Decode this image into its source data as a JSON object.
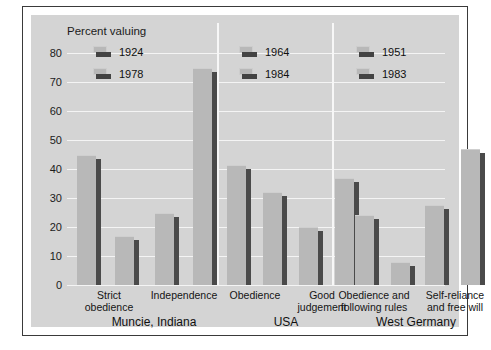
{
  "chart_data": {
    "type": "bar",
    "title": "",
    "ylabel": "Percent valuing",
    "xlabel": "",
    "ylim": [
      0,
      80
    ],
    "yticks": [
      0,
      10,
      20,
      30,
      40,
      50,
      60,
      70,
      80
    ],
    "grid": true,
    "legend_position": "inside-top-left-per-panel",
    "panels": [
      {
        "name": "Muncie, Indiana",
        "series": [
          {
            "name": "1924",
            "color": "#b8b8b8"
          },
          {
            "name": "1978",
            "color": "#b8b8b8"
          }
        ],
        "categories": [
          "Strict obedience",
          "Independence"
        ],
        "data": [
          {
            "category": "Strict obedience",
            "values": [
              45,
              17
            ]
          },
          {
            "category": "Independence",
            "values": [
              25,
              75
            ]
          }
        ]
      },
      {
        "name": "USA",
        "series": [
          {
            "name": "1964",
            "color": "#b8b8b8"
          },
          {
            "name": "1984",
            "color": "#b8b8b8"
          }
        ],
        "categories": [
          "Obedience",
          "Good judgement"
        ],
        "data": [
          {
            "category": "Obedience",
            "values": [
              41.5,
              32
            ]
          },
          {
            "category": "Good judgement",
            "values": [
              20,
              37
            ]
          }
        ]
      },
      {
        "name": "West Germany",
        "series": [
          {
            "name": "1951",
            "color": "#b8b8b8"
          },
          {
            "name": "1983",
            "color": "#b8b8b8"
          }
        ],
        "categories": [
          "Obedience and following rules",
          "Self-reliance and free will"
        ],
        "data": [
          {
            "category": "Obedience and following rules",
            "values": [
              24,
              8
            ]
          },
          {
            "category": "Self-reliance and free will",
            "values": [
              27.5,
              47
            ]
          }
        ]
      }
    ]
  },
  "axis": {
    "title": "Percent valuing",
    "ticks": [
      "80",
      "70",
      "60",
      "50",
      "40",
      "30",
      "20",
      "10",
      "0"
    ]
  },
  "legends": {
    "muncie": [
      {
        "label": "1924"
      },
      {
        "label": "1978"
      }
    ],
    "usa": [
      {
        "label": "1964"
      },
      {
        "label": "1984"
      }
    ],
    "westgermany": [
      {
        "label": "1951"
      },
      {
        "label": "1983"
      }
    ]
  },
  "categories": {
    "strict_obedience_line1": "Strict",
    "strict_obedience_line2": "obedience",
    "independence": "Independence",
    "obedience": "Obedience",
    "good_judgement_line1": "Good",
    "good_judgement_line2": "judgement",
    "obedience_rules_line1": "Obedience and",
    "obedience_rules_line2": "following rules",
    "self_reliance_line1": "Self-reliance",
    "self_reliance_line2": "and free will"
  },
  "groups": {
    "muncie": "Muncie, Indiana",
    "usa": "USA",
    "westgermany": "West Germany"
  }
}
